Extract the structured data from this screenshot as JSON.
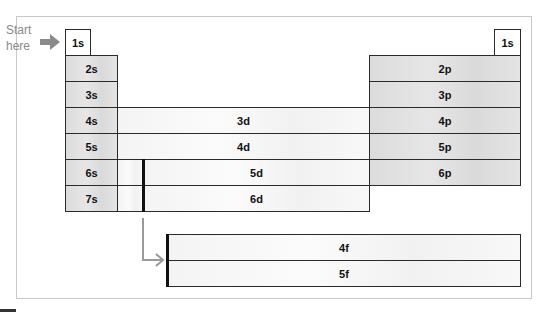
{
  "start_label": {
    "line1": "Start",
    "line2": "here"
  },
  "cells": {
    "s1_left": "1s",
    "s1_right": "1s",
    "s": [
      "2s",
      "3s",
      "4s",
      "5s",
      "6s",
      "7s"
    ],
    "p": [
      "2p",
      "3p",
      "4p",
      "5p",
      "6p"
    ],
    "d": [
      "3d",
      "4d",
      "5d",
      "6d"
    ],
    "f": [
      "4f",
      "5f"
    ]
  },
  "colors": {
    "s_block": "#e0e0e0",
    "p_block": "#e2e2e2",
    "d_block": "#f6f6f6",
    "f_block": "#f6f6f6",
    "arrow": "#9a9a9a",
    "start_arrow": "#8a8a8a"
  }
}
